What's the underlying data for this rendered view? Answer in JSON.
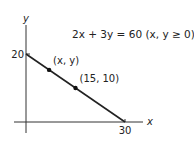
{
  "chart_data": {
    "type": "line",
    "title": "2x + 3y = 60 (x, y ≥ 0)",
    "xlabel": "x",
    "ylabel": "y",
    "xlim": [
      0,
      30
    ],
    "ylim": [
      0,
      20
    ],
    "grid": false,
    "x_ticks": [
      {
        "value": 30,
        "label": "30"
      }
    ],
    "y_ticks": [
      {
        "value": 20,
        "label": "20"
      }
    ],
    "series": [
      {
        "name": "2x + 3y = 60",
        "points": [
          [
            0,
            20
          ],
          [
            30,
            0
          ]
        ]
      }
    ],
    "marked_points": [
      {
        "label": "(x, y)",
        "x": 7,
        "y": 15.33
      },
      {
        "label": "(15, 10)",
        "x": 15,
        "y": 10
      }
    ],
    "annotations": [
      {
        "text": "2x + 3y = 60 (x, y ≥ 0)",
        "position": "top-right"
      }
    ]
  }
}
